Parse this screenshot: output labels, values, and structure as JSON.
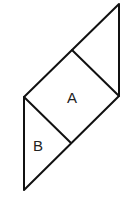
{
  "diagram": {
    "stroke_color": "#111111",
    "background": "#ffffff",
    "vertices": {
      "top_right": [
        119,
        4
      ],
      "right_mid": [
        119,
        96
      ],
      "left_mid": [
        24,
        97
      ],
      "bottom_left": [
        24,
        190
      ],
      "upper_junction": [
        72,
        50
      ],
      "lower_junction": [
        71,
        143
      ]
    },
    "regions": [
      {
        "id": "A",
        "label": "A",
        "shape": "square",
        "label_pos": [
          72,
          102
        ]
      },
      {
        "id": "B",
        "label": "B",
        "shape": "triangle",
        "label_pos": [
          38,
          150
        ]
      }
    ]
  }
}
